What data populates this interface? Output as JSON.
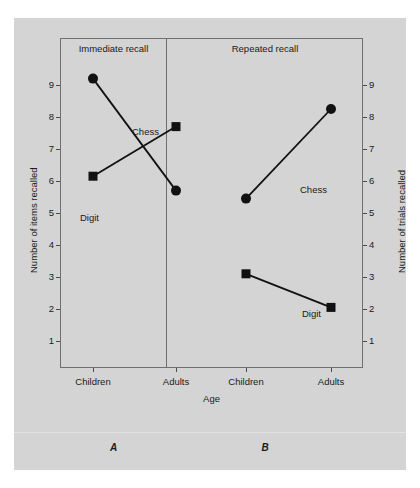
{
  "figure": {
    "caption_letters": [
      "A",
      "B"
    ]
  },
  "chart_data": {
    "type": "line",
    "title": "",
    "panels": [
      {
        "key": "A",
        "title": "Immediate recall",
        "caption": "A",
        "xlabel": "Age",
        "ylabel": "Number of items recalled",
        "categories": [
          "Children",
          "Adults"
        ],
        "ylim": [
          0,
          9.8
        ],
        "yticks": [
          1,
          2,
          3,
          4,
          5,
          6,
          7,
          8,
          9
        ],
        "grid": false,
        "series": [
          {
            "name": "Chess",
            "marker": "circle",
            "values": [
              9.2,
              5.7
            ]
          },
          {
            "name": "Digit",
            "marker": "square",
            "values": [
              6.15,
              7.7
            ]
          }
        ]
      },
      {
        "key": "B",
        "title": "Repeated recall",
        "caption": "B",
        "xlabel": "Age",
        "ylabel": "Number of trials recalled",
        "categories": [
          "Children",
          "Adults"
        ],
        "ylim": [
          0,
          9.8
        ],
        "yticks": [
          1,
          2,
          3,
          4,
          5,
          6,
          7,
          8,
          9
        ],
        "grid": false,
        "series": [
          {
            "name": "Chess",
            "marker": "circle",
            "values": [
              5.45,
              8.25
            ]
          },
          {
            "name": "Digit",
            "marker": "square",
            "values": [
              3.1,
              2.05
            ]
          }
        ]
      }
    ],
    "axes": {
      "left_title": "Number of items recalled",
      "right_title": "Number of trials recalled",
      "x_title": "Age",
      "yticks": [
        1,
        2,
        3,
        4,
        5,
        6,
        7,
        8,
        9
      ],
      "xticks": [
        "Children",
        "Adults",
        "Children",
        "Adults"
      ]
    },
    "colors": {
      "background": "#d4d4d4",
      "page": "#ffffff",
      "frame": "#6e6e73",
      "ink": "#111111",
      "text": "#1a1a1a"
    }
  }
}
